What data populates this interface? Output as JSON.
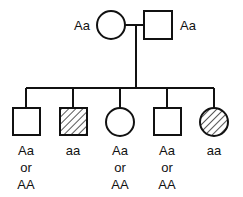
{
  "parents": {
    "mother": {
      "sex": "female",
      "genotype": "Aa",
      "affected": false
    },
    "father": {
      "sex": "male",
      "genotype": "Aa",
      "affected": false
    }
  },
  "children": [
    {
      "sex": "male",
      "affected": false,
      "genotype_lines": [
        "Aa",
        "or",
        "AA"
      ]
    },
    {
      "sex": "male",
      "affected": true,
      "genotype_lines": [
        "aa"
      ]
    },
    {
      "sex": "female",
      "affected": false,
      "genotype_lines": [
        "Aa",
        "or",
        "AA"
      ]
    },
    {
      "sex": "male",
      "affected": false,
      "genotype_lines": [
        "Aa",
        "or",
        "AA"
      ]
    },
    {
      "sex": "female",
      "affected": true,
      "genotype_lines": [
        "aa"
      ]
    }
  ]
}
